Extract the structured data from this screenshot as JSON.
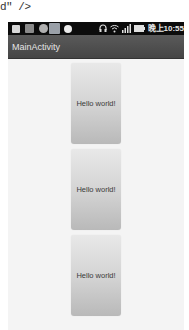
{
  "code_fragment": "d\" />",
  "status_bar": {
    "left_icons": [
      "notification-icon",
      "usb-icon",
      "sync-icon",
      "photo-icon",
      "clock-icon"
    ],
    "right_icons": [
      "headset-icon",
      "wifi-icon",
      "signal-icon",
      "battery-icon"
    ],
    "time": "晚上10:55"
  },
  "action_bar": {
    "title": "MainActivity"
  },
  "cards": [
    {
      "text": "Hello world!"
    },
    {
      "text": "Hello world!"
    },
    {
      "text": "Hello world!"
    }
  ],
  "colors": {
    "status_bar_bg": "#0c0c0c",
    "action_bar_bg": "#4f4f4f",
    "content_bg": "#f4f4f4",
    "card_top": "#e8e8e8",
    "card_bottom": "#b9b9b9"
  }
}
